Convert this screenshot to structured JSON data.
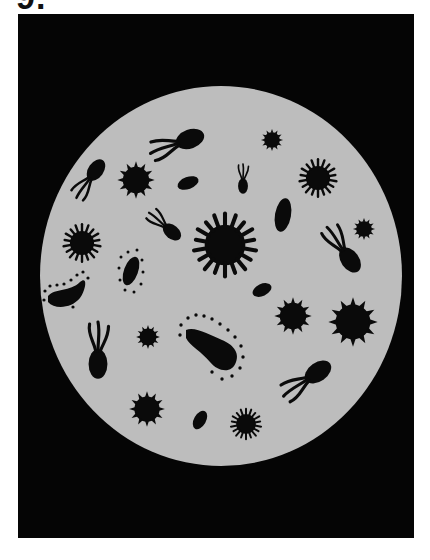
{
  "figure": {
    "header_label": "9.",
    "colors": {
      "background": "#ffffff",
      "frame": "#050505",
      "dish": "#bdbdbd",
      "organisms": "#0a0a0a"
    },
    "dish": {
      "cx": 221,
      "cy": 276,
      "rx": 181,
      "ry": 190
    },
    "organisms": [
      {
        "type": "flagellate",
        "label": "tadpole-top"
      },
      {
        "type": "flagellate",
        "label": "tadpole-left"
      },
      {
        "type": "flagellate",
        "label": "tadpole-small-vertical"
      },
      {
        "type": "flagellate",
        "label": "tadpole-center-left"
      },
      {
        "type": "flagellate",
        "label": "tadpole-right"
      },
      {
        "type": "flagellate",
        "label": "tadpole-lower-left"
      },
      {
        "type": "flagellate",
        "label": "tadpole-lower-right"
      },
      {
        "type": "spiky-coccus",
        "count": 9
      },
      {
        "type": "fuzzy-coccus",
        "count": 4
      },
      {
        "type": "bean-bacillus",
        "count": 4
      },
      {
        "type": "dotted-bacillus",
        "count": 4
      }
    ]
  }
}
